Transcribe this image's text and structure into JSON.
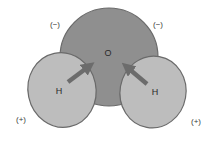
{
  "diagram": {
    "atoms": {
      "oxygen": {
        "label": "O",
        "charge": "(−)"
      },
      "hydrogen_left": {
        "label": "H",
        "charge": "(+)"
      },
      "hydrogen_right": {
        "label": "H",
        "charge": "(+)"
      }
    },
    "charges": {
      "negative_left": "(−)",
      "negative_right": "(−)",
      "positive_left": "(+)",
      "positive_right": "(+)"
    },
    "arrows": [
      {
        "from": "hydrogen_left",
        "to": "oxygen",
        "meaning": "electron pull toward oxygen"
      },
      {
        "from": "hydrogen_right",
        "to": "oxygen",
        "meaning": "electron pull toward oxygen"
      }
    ],
    "colors": {
      "oxygen_fill": "#8f8f8f",
      "hydrogen_fill": "#bdbdbd",
      "outline": "#6a6a6a",
      "arrow": "#6c6c6c",
      "background": "#ffffff"
    }
  }
}
